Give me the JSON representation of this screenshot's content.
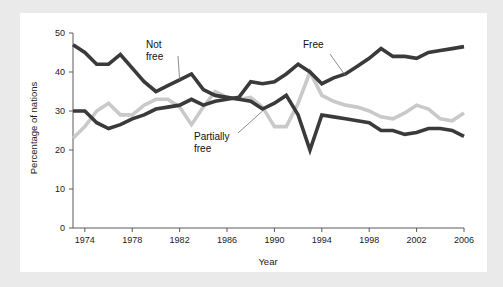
{
  "figure": {
    "background_color": "#ebeaea",
    "panel_color": "#ffffff"
  },
  "chart_data": {
    "type": "line",
    "title": "",
    "xlabel": "Year",
    "ylabel": "Percentage of nations",
    "xlim": [
      1973,
      2006
    ],
    "ylim": [
      0,
      50
    ],
    "grid": false,
    "legend_position": "inline-annotations",
    "xticks": [
      1974,
      1978,
      1982,
      1986,
      1990,
      1994,
      1998,
      2002,
      2006
    ],
    "xtick_labels": [
      "1974",
      "1978",
      "1982",
      "1986",
      "1990",
      "1994",
      "1998",
      "2002",
      "2006"
    ],
    "yticks": [
      0,
      10,
      20,
      30,
      40,
      50
    ],
    "ytick_labels": [
      "0",
      "10",
      "20",
      "30",
      "40",
      "50"
    ],
    "x": [
      1973,
      1974,
      1975,
      1976,
      1977,
      1978,
      1979,
      1980,
      1981,
      1982,
      1983,
      1984,
      1985,
      1986,
      1987,
      1988,
      1989,
      1990,
      1991,
      1992,
      1993,
      1994,
      1995,
      1996,
      1997,
      1998,
      1999,
      2000,
      2001,
      2002,
      2003,
      2004,
      2005,
      2006
    ],
    "series": [
      {
        "name": "Not free",
        "color": "#3a3a3a",
        "values": [
          47.0,
          45.0,
          42.0,
          42.0,
          44.5,
          41.0,
          37.5,
          35.0,
          36.5,
          38.0,
          39.5,
          35.5,
          34.0,
          33.5,
          33.0,
          32.5,
          30.5,
          32.0,
          34.0,
          29.0,
          20.0,
          29.0,
          28.5,
          28.0,
          27.5,
          27.0,
          25.0,
          25.0,
          24.0,
          24.5,
          25.5,
          25.5,
          25.0,
          23.5
        ]
      },
      {
        "name": "Partially free",
        "color": "#c9c9c9",
        "values": [
          23.0,
          26.0,
          30.0,
          32.0,
          29.0,
          29.0,
          31.5,
          33.0,
          33.0,
          31.0,
          26.5,
          31.0,
          35.0,
          33.5,
          33.0,
          33.5,
          31.0,
          26.0,
          26.0,
          32.0,
          40.0,
          34.0,
          32.5,
          31.5,
          31.0,
          30.0,
          28.5,
          28.0,
          29.5,
          31.5,
          30.5,
          28.0,
          27.5,
          29.5
        ]
      },
      {
        "name": "Free",
        "color": "#3a3a3a",
        "values": [
          30.0,
          30.0,
          27.0,
          25.5,
          26.5,
          28.0,
          29.0,
          30.5,
          31.0,
          31.5,
          33.0,
          31.5,
          32.5,
          33.0,
          33.5,
          37.5,
          37.0,
          37.5,
          39.5,
          42.0,
          40.0,
          37.0,
          38.5,
          39.5,
          41.5,
          43.5,
          46.0,
          44.0,
          44.0,
          43.5,
          45.0,
          45.5,
          46.0,
          46.5
        ]
      }
    ],
    "annotations": [
      {
        "id": "not-free-label",
        "text_lines": [
          "Not",
          "free"
        ],
        "points_to_year": 1982,
        "points_to_value": 38.0
      },
      {
        "id": "partially-free-label",
        "text_lines": [
          "Partially",
          "free"
        ],
        "points_to_year": 1989,
        "points_to_value": 30.0
      },
      {
        "id": "free-label",
        "text_lines": [
          "Free"
        ],
        "points_to_year": 1996,
        "points_to_value": 39.0
      }
    ]
  }
}
